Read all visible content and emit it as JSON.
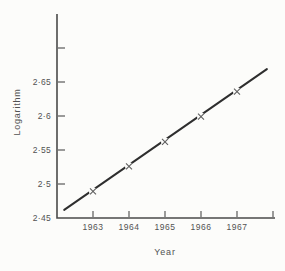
{
  "figure": {
    "background": "#fcfcfa",
    "axis_color": "#4a4a4a",
    "text_color": "#525252",
    "line_color": "#2e2e2e",
    "marker_color": "#5f5f5f"
  },
  "chart_data": {
    "type": "line",
    "title": "",
    "xlabel": "Year",
    "ylabel": "Logarithm",
    "x": [
      1963,
      1964,
      1965,
      1966,
      1967
    ],
    "values": [
      2.489,
      2.526,
      2.562,
      2.599,
      2.636
    ],
    "marker": "x",
    "fit_line": {
      "x1": 1962.2,
      "y1": 2.462,
      "x2": 1967.83,
      "y2": 2.669
    },
    "xlim": [
      1962,
      1968
    ],
    "ylim": [
      2.45,
      2.75
    ],
    "x_ticks": [
      {
        "value": 1963,
        "label": "1963",
        "tick": true
      },
      {
        "value": 1964,
        "label": "1964",
        "tick": true
      },
      {
        "value": 1965,
        "label": "1965",
        "tick": true
      },
      {
        "value": 1966,
        "label": "1966",
        "tick": true
      },
      {
        "value": 1967,
        "label": "1967",
        "tick": true
      },
      {
        "value": 1968,
        "label": "",
        "tick": true
      }
    ],
    "y_ticks": [
      {
        "value": 2.45,
        "label": "2·45",
        "tick": false
      },
      {
        "value": 2.5,
        "label": "2·5",
        "tick": true
      },
      {
        "value": 2.55,
        "label": "2·55",
        "tick": true
      },
      {
        "value": 2.6,
        "label": "2·6",
        "tick": true
      },
      {
        "value": 2.65,
        "label": "2·65",
        "tick": true
      },
      {
        "value": 2.7,
        "label": "",
        "tick": true
      }
    ],
    "grid": false,
    "legend": null
  }
}
